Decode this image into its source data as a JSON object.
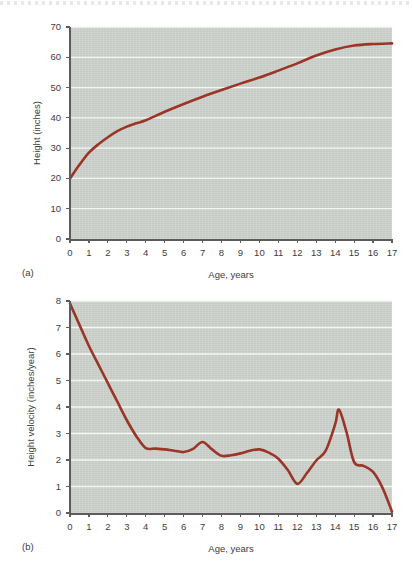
{
  "figure": {
    "panels": [
      {
        "tag": "(a)",
        "xlabel": "Age, years",
        "ylabel": "Height (inches)"
      },
      {
        "tag": "(b)",
        "xlabel": "Age, years",
        "ylabel": "Height velocity (inches/year)"
      }
    ],
    "colors": {
      "series": "#9b3527",
      "panel_background": "#ced3ce",
      "gridline": "#f4f6f4",
      "axis": "#5c5c5c",
      "text": "#3d3d3d",
      "page_background": "#ffffff"
    }
  },
  "chart_data": [
    {
      "type": "line",
      "title": "",
      "panel_tag": "(a)",
      "xlabel": "Age, years",
      "ylabel": "Height (inches)",
      "xlim": [
        0,
        17
      ],
      "ylim": [
        0,
        70
      ],
      "xticks": [
        0,
        1,
        2,
        3,
        4,
        5,
        6,
        7,
        8,
        9,
        10,
        11,
        12,
        13,
        14,
        15,
        16,
        17
      ],
      "yticks": [
        0,
        10,
        20,
        30,
        40,
        50,
        60,
        70
      ],
      "xtick_labels": [
        "0",
        "1",
        "2",
        "3",
        "4",
        "5",
        "6",
        "7",
        "8",
        "9",
        "10",
        "11",
        "12",
        "13",
        "14",
        "15",
        "16",
        "17"
      ],
      "ytick_labels": [
        "0",
        "10",
        "20",
        "30",
        "40",
        "50",
        "60",
        "70"
      ],
      "grid": "horizontal",
      "legend": "none",
      "series": [
        {
          "name": "Height",
          "color": "#9b3527",
          "x": [
            0,
            0.5,
            1,
            1.5,
            2,
            2.5,
            3,
            3.5,
            4,
            5,
            6,
            7,
            8,
            9,
            10,
            11,
            12,
            13,
            14,
            15,
            16,
            17
          ],
          "y": [
            20.0,
            24.5,
            28.5,
            31.3,
            33.6,
            35.6,
            37.1,
            38.2,
            39.2,
            42.0,
            44.6,
            47.0,
            49.2,
            51.3,
            53.3,
            55.6,
            58.0,
            60.6,
            62.6,
            63.9,
            64.4,
            64.6
          ]
        }
      ]
    },
    {
      "type": "line",
      "title": "",
      "panel_tag": "(b)",
      "xlabel": "Age, years",
      "ylabel": "Height velocity (inches/year)",
      "xlim": [
        0,
        17
      ],
      "ylim": [
        0,
        8
      ],
      "xticks": [
        0,
        1,
        2,
        3,
        4,
        5,
        6,
        7,
        8,
        9,
        10,
        11,
        12,
        13,
        14,
        15,
        16,
        17
      ],
      "yticks": [
        0,
        1,
        2,
        3,
        4,
        5,
        6,
        7,
        8
      ],
      "xtick_labels": [
        "0",
        "1",
        "2",
        "3",
        "4",
        "5",
        "6",
        "7",
        "8",
        "9",
        "10",
        "11",
        "12",
        "13",
        "14",
        "15",
        "16",
        "17"
      ],
      "ytick_labels": [
        "0",
        "1",
        "2",
        "3",
        "4",
        "5",
        "6",
        "7",
        "8"
      ],
      "grid": "horizontal",
      "legend": "none",
      "series": [
        {
          "name": "Height velocity",
          "color": "#9b3527",
          "x": [
            0,
            0.5,
            1,
            1.5,
            2,
            2.5,
            3,
            3.5,
            4,
            4.5,
            5,
            5.5,
            6,
            6.5,
            7,
            7.5,
            8,
            8.5,
            9,
            9.5,
            10,
            10.5,
            11,
            11.5,
            12,
            12.5,
            13,
            13.5,
            14,
            14.2,
            14.6,
            15,
            15.5,
            16,
            16.5,
            17
          ],
          "y": [
            7.9,
            7.1,
            6.3,
            5.6,
            4.9,
            4.2,
            3.5,
            2.9,
            2.45,
            2.43,
            2.4,
            2.35,
            2.3,
            2.42,
            2.68,
            2.4,
            2.16,
            2.18,
            2.25,
            2.35,
            2.4,
            2.28,
            2.05,
            1.62,
            1.1,
            1.5,
            1.98,
            2.35,
            3.35,
            3.9,
            3.05,
            1.92,
            1.78,
            1.55,
            0.95,
            0.05
          ]
        }
      ]
    }
  ]
}
